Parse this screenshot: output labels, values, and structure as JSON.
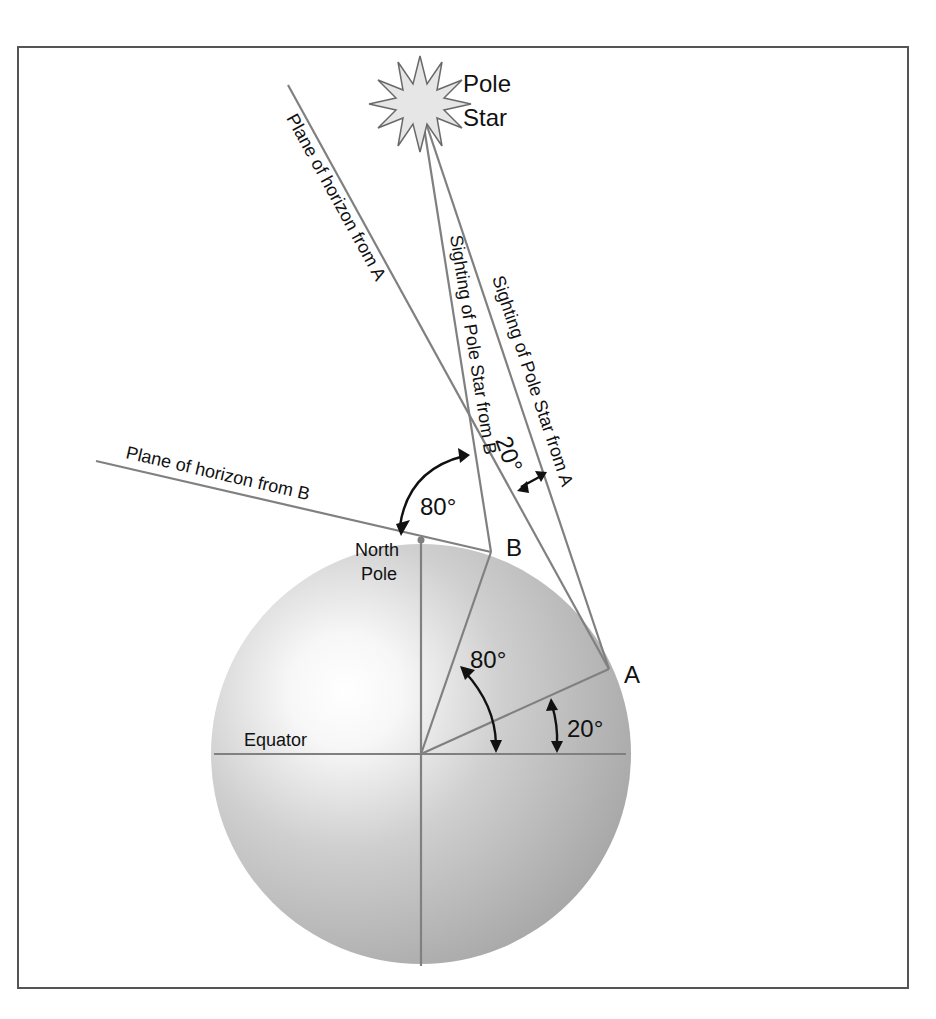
{
  "diagram": {
    "star_label_line1": "Pole",
    "star_label_line2": "Star",
    "labels": {
      "horizon_a": "Plane of horizon from A",
      "horizon_b": "Plane of horizon from B",
      "sighting_b": "Sighting of Pole Star from B",
      "sighting_a": "Sighting of Pole Star from A",
      "north_pole_line1": "North",
      "north_pole_line2": "Pole",
      "equator": "Equator",
      "point_a": "A",
      "point_b": "B"
    },
    "angles": {
      "b_horizon_to_star": "80°",
      "a_horizon_to_star": "20°",
      "b_latitude": "80°",
      "a_latitude": "20°"
    },
    "colors": {
      "globe_light": "#ffffff",
      "globe_dark": "#a9a9a9",
      "line": "#808080",
      "star_fill": "#e6e6e6",
      "text": "#111111"
    }
  }
}
